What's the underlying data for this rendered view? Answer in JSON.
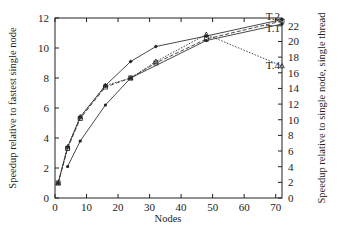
{
  "chart_data": {
    "type": "line",
    "title": "",
    "xlabel": "Nodes",
    "ylabel": "Speedup relative to fastest single node",
    "y2label": "Speedup relative to single node, single thread",
    "xlim": [
      0,
      72
    ],
    "ylim": [
      0,
      12
    ],
    "y2lim": [
      0,
      23
    ],
    "xticks": [
      0,
      10,
      20,
      30,
      40,
      50,
      60,
      70
    ],
    "yticks": [
      0,
      2,
      4,
      6,
      8,
      10,
      12
    ],
    "y2ticks": [
      0,
      2,
      4,
      6,
      8,
      10,
      12,
      14,
      16,
      18,
      20,
      22
    ],
    "grid": false,
    "legend": "inline labels at right end",
    "series": [
      {
        "name": "T.2",
        "style": "solid",
        "marker": "diamond",
        "x": [
          1,
          4,
          8,
          16,
          24,
          32,
          48,
          72
        ],
        "values": [
          1.0,
          3.4,
          5.4,
          7.5,
          9.1,
          10.1,
          10.8,
          11.9
        ]
      },
      {
        "name": "T.3",
        "style": "dashed",
        "marker": "square",
        "x": [
          1,
          4,
          8,
          16,
          24,
          32,
          48,
          72
        ],
        "values": [
          1.0,
          3.3,
          5.3,
          7.4,
          8.0,
          9.0,
          10.6,
          11.8
        ]
      },
      {
        "name": "T.1",
        "style": "solid",
        "marker": "dot",
        "x": [
          4,
          8,
          16,
          24,
          48,
          72
        ],
        "values": [
          2.1,
          3.8,
          6.2,
          8.0,
          10.5,
          11.6
        ]
      },
      {
        "name": "T.4",
        "style": "dotted",
        "marker": "triangle",
        "x": [
          1,
          4,
          8,
          16,
          24,
          32,
          48,
          72
        ],
        "values": [
          1.0,
          3.4,
          5.4,
          7.5,
          8.0,
          9.1,
          10.9,
          8.8
        ]
      }
    ],
    "labels": [
      {
        "text": "T.2",
        "x": 72,
        "y": 12.1
      },
      {
        "text": "T.1",
        "x": 72,
        "y": 11.3
      },
      {
        "text": "T.4",
        "x": 72,
        "y": 8.8
      }
    ]
  }
}
